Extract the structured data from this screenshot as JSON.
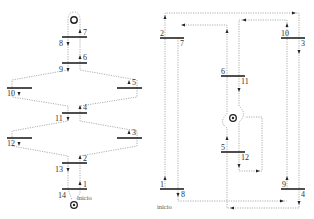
{
  "diagram": {
    "left": {
      "start_label": "início",
      "bars": [
        {
          "id": "b78",
          "labels": [
            "7",
            "8"
          ]
        },
        {
          "id": "b69",
          "labels": [
            "6",
            "9"
          ]
        },
        {
          "id": "b10",
          "labels": [
            "10"
          ]
        },
        {
          "id": "b5",
          "labels": [
            "5"
          ]
        },
        {
          "id": "b411",
          "labels": [
            "4",
            "11"
          ]
        },
        {
          "id": "b12",
          "labels": [
            "12"
          ]
        },
        {
          "id": "b3",
          "labels": [
            "3"
          ]
        },
        {
          "id": "b213",
          "labels": [
            "2",
            "13"
          ]
        },
        {
          "id": "b114",
          "labels": [
            "1",
            "14"
          ]
        }
      ],
      "labels": {
        "n1": "1",
        "n2": "2",
        "n3": "3",
        "n4": "4",
        "n5": "5",
        "n6": "6",
        "n7": "7",
        "n8": "8",
        "n9": "9",
        "n10": "10",
        "n11": "11",
        "n12": "12",
        "n13": "13",
        "n14": "14"
      }
    },
    "right": {
      "start_label": "início",
      "labels": {
        "n1": "1",
        "n2": "2",
        "n3": "3",
        "n4": "4",
        "n5": "5",
        "n6": "6",
        "n7": "7",
        "n8": "8",
        "n9": "9",
        "n10": "10",
        "n11": "11",
        "n12": "12"
      }
    }
  }
}
